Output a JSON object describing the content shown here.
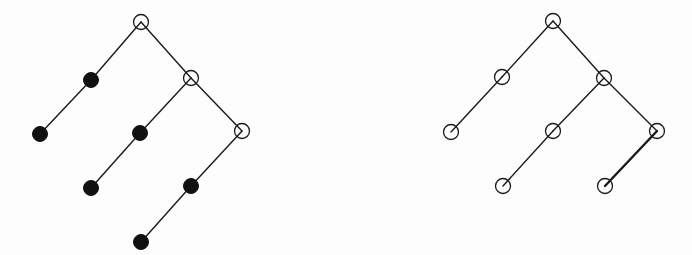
{
  "colors": {
    "background": "#fdfdfd",
    "stroke": "#1a1a1a",
    "filled": "#111111",
    "hollow_fill": "#ffffff"
  },
  "node_radius": 7.5,
  "trees": [
    {
      "id": "left-tree",
      "nodes": [
        {
          "id": "L0",
          "x": 141,
          "y": 22,
          "style": "hollow"
        },
        {
          "id": "L1",
          "x": 91,
          "y": 80,
          "style": "filled"
        },
        {
          "id": "L2",
          "x": 191,
          "y": 78,
          "style": "hollow"
        },
        {
          "id": "L3",
          "x": 40,
          "y": 134,
          "style": "filled"
        },
        {
          "id": "L4",
          "x": 140,
          "y": 133,
          "style": "filled"
        },
        {
          "id": "L5",
          "x": 242,
          "y": 131,
          "style": "hollow"
        },
        {
          "id": "L6",
          "x": 91,
          "y": 188,
          "style": "filled"
        },
        {
          "id": "L7",
          "x": 191,
          "y": 186,
          "style": "filled"
        },
        {
          "id": "L8",
          "x": 141,
          "y": 242,
          "style": "filled"
        }
      ],
      "edges": [
        {
          "from": "L0",
          "to": "L1",
          "width": 1.4
        },
        {
          "from": "L0",
          "to": "L2",
          "width": 1.4
        },
        {
          "from": "L1",
          "to": "L3",
          "width": 1.4
        },
        {
          "from": "L2",
          "to": "L4",
          "width": 1.4
        },
        {
          "from": "L2",
          "to": "L5",
          "width": 1.4
        },
        {
          "from": "L4",
          "to": "L6",
          "width": 1.4
        },
        {
          "from": "L5",
          "to": "L7",
          "width": 1.4
        },
        {
          "from": "L7",
          "to": "L8",
          "width": 1.4
        }
      ]
    },
    {
      "id": "right-tree",
      "nodes": [
        {
          "id": "R0",
          "x": 553,
          "y": 21,
          "style": "hollow"
        },
        {
          "id": "R1",
          "x": 502,
          "y": 77,
          "style": "hollow"
        },
        {
          "id": "R2",
          "x": 604,
          "y": 78,
          "style": "hollow"
        },
        {
          "id": "R3",
          "x": 451,
          "y": 132,
          "style": "hollow"
        },
        {
          "id": "R4",
          "x": 553,
          "y": 131,
          "style": "hollow"
        },
        {
          "id": "R5",
          "x": 657,
          "y": 131,
          "style": "hollow"
        },
        {
          "id": "R6",
          "x": 503,
          "y": 186,
          "style": "hollow"
        },
        {
          "id": "R7",
          "x": 605,
          "y": 186,
          "style": "hollow"
        }
      ],
      "edges": [
        {
          "from": "R0",
          "to": "R1",
          "width": 1.4
        },
        {
          "from": "R0",
          "to": "R2",
          "width": 1.4
        },
        {
          "from": "R1",
          "to": "R3",
          "width": 1.4
        },
        {
          "from": "R2",
          "to": "R4",
          "width": 1.4
        },
        {
          "from": "R2",
          "to": "R5",
          "width": 1.4
        },
        {
          "from": "R4",
          "to": "R6",
          "width": 1.4
        },
        {
          "from": "R5",
          "to": "R7",
          "width": 2.4
        }
      ]
    }
  ]
}
